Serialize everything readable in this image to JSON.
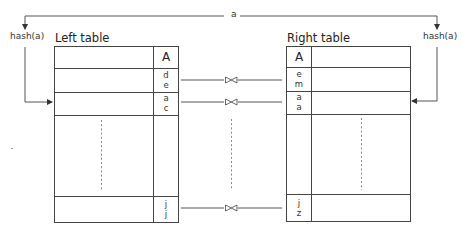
{
  "diagram": {
    "top_label": "a",
    "left_hash_label": "hash(a)",
    "right_hash_label": "hash(a)",
    "left_table": {
      "title": "Left table",
      "column_header": "A",
      "rows": [
        {
          "values": [
            "d",
            "e"
          ]
        },
        {
          "values": [
            "a",
            "c"
          ]
        },
        {
          "values": []
        },
        {
          "values": [
            "j",
            "j"
          ]
        }
      ]
    },
    "right_table": {
      "title": "Right table",
      "column_header": "A",
      "rows": [
        {
          "values": [
            "e",
            "m"
          ]
        },
        {
          "values": [
            "a",
            "a"
          ]
        },
        {
          "values": []
        },
        {
          "values": [
            "j",
            "z"
          ]
        }
      ]
    },
    "join_symbol": "⋈",
    "join_links": [
      {
        "left_row": 0,
        "right_row": 0
      },
      {
        "left_row": 1,
        "right_row": 1
      },
      {
        "left_row": 3,
        "right_row": 3
      }
    ],
    "colors": {
      "line": "#555555",
      "dashed": "#8a8a8a",
      "text": "#222222"
    }
  }
}
